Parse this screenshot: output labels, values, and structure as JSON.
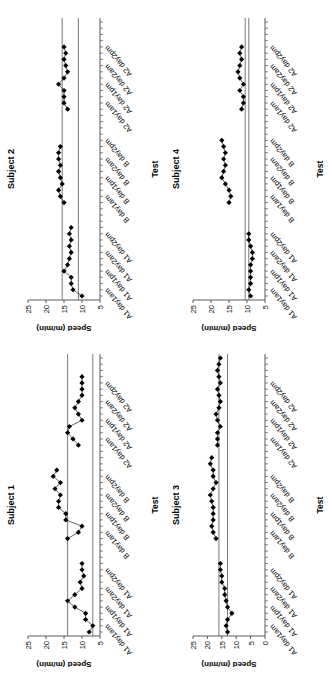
{
  "chart_data": [
    {
      "type": "line",
      "title": "Subject 2",
      "xlabel": "Test",
      "ylabel": "Speed (m/min)",
      "ylim": [
        5,
        25
      ],
      "yticks": [
        5,
        10,
        15,
        20,
        25
      ],
      "tick_labels": [
        "A1 day1am",
        "A1 day1pm",
        "A1 day2am",
        "A1 day2pm",
        "B day1am",
        "B day1pm",
        "B day2am",
        "B day2pm",
        "A2 day1am",
        "A2 day1pm",
        "A2 day2am",
        "A2 day2pm"
      ],
      "reference_lines": [
        11,
        15.5
      ],
      "series": [
        {
          "name": "A1",
          "values": [
            10,
            12.5,
            13,
            13,
            15,
            14,
            13.5,
            13,
            13.5,
            13,
            13.5,
            13
          ]
        },
        {
          "name": "B",
          "values": [
            15,
            16,
            16.5,
            15.5,
            16,
            16.5,
            16,
            16.5,
            16.5,
            16
          ]
        },
        {
          "name": "A2",
          "values": [
            14,
            15,
            15,
            15,
            16.5,
            15,
            14,
            14.5,
            15,
            14.5,
            15
          ]
        }
      ]
    },
    {
      "type": "line",
      "title": "Subject 4",
      "xlabel": "Test",
      "ylabel": "Speed (m/min)",
      "ylim": [
        5,
        25
      ],
      "yticks": [
        5,
        10,
        15,
        20,
        25
      ],
      "tick_labels": [
        "A1 day1am",
        "A1 day1pm",
        "A1 day2am",
        "A1 day2pm",
        "B day1am",
        "B day1pm",
        "B day2am",
        "B day2pm",
        "A2 day1am",
        "A2 day1pm",
        "A2 day2am",
        "A2 day2pm"
      ],
      "reference_lines": [
        9.5,
        10.5
      ],
      "series": [
        {
          "name": "A1",
          "values": [
            9,
            9.5,
            9,
            9,
            9,
            9,
            8.5,
            8.5,
            9,
            9.5,
            9.5
          ]
        },
        {
          "name": "B",
          "values": [
            15,
            14.5,
            15,
            16,
            17,
            16.5,
            16,
            16.5,
            16,
            16.5,
            17
          ]
        },
        {
          "name": "A2",
          "values": [
            11.5,
            11,
            11,
            12,
            11,
            12,
            12.5,
            12,
            11.5,
            12,
            11.5
          ]
        }
      ]
    },
    {
      "type": "line",
      "title": "Subject 1",
      "xlabel": "Test",
      "ylabel": "Speed (m/min)",
      "ylim": [
        5,
        25
      ],
      "yticks": [
        5,
        10,
        15,
        20,
        25
      ],
      "tick_labels": [
        "A1 day1am",
        "A1 day1pm",
        "A1 day2am",
        "A1 day2pm",
        "B day1am",
        "B day1pm",
        "B day2am",
        "B day2pm",
        "A2 day1am",
        "A2 day1pm",
        "A2 day2am",
        "A2 day2pm"
      ],
      "reference_lines": [
        7,
        14
      ],
      "series": [
        {
          "name": "A1",
          "values": [
            8,
            7,
            9,
            9,
            12,
            14,
            12,
            10,
            10.5,
            9.5,
            10,
            10
          ]
        },
        {
          "name": "B",
          "values": [
            14,
            11,
            10,
            14.5,
            14.5,
            16.5,
            16.5,
            16,
            17.5,
            16,
            18,
            17
          ]
        },
        {
          "name": "A2",
          "values": [
            11,
            12.5,
            14,
            13.5,
            10,
            11,
            12,
            11,
            10,
            10,
            10,
            10
          ]
        }
      ]
    },
    {
      "type": "line",
      "title": "Subject 3",
      "xlabel": "Test",
      "ylabel": "Speed (m/min)",
      "ylim": [
        0,
        25
      ],
      "yticks": [
        0,
        5,
        10,
        15,
        20,
        25
      ],
      "tick_labels": [
        "A1 day1am",
        "A1 day1pm",
        "A1 day2am",
        "A1 day2pm",
        "B day1am",
        "B day1pm",
        "B day2am",
        "B day2pm",
        "A2 day1am",
        "A2 day1pm",
        "A2 day2am",
        "A2 day2pm"
      ],
      "reference_lines": [
        13,
        16
      ],
      "series": [
        {
          "name": "A1",
          "values": [
            13,
            13.5,
            13,
            11.5,
            13,
            13.5,
            14,
            14,
            15,
            15,
            15.5,
            15.5
          ]
        },
        {
          "name": "B",
          "values": [
            17,
            18,
            18.5,
            18,
            18,
            18,
            18.5,
            19,
            18,
            17,
            18,
            18,
            19,
            18.5
          ]
        },
        {
          "name": "A2",
          "values": [
            16.5,
            16.5,
            16.5,
            15.5,
            16.5,
            17,
            16,
            15.5,
            16,
            16.5,
            15.5,
            16,
            16.5,
            16,
            15.5
          ]
        }
      ]
    }
  ],
  "panels": [
    {
      "title": "Subject 2",
      "ylabel": "Speed (m/min)",
      "xlabel": "Test"
    },
    {
      "title": "Subject 4",
      "ylabel": "Speed (m/min)",
      "xlabel": "Test"
    },
    {
      "title": "Subject 1",
      "ylabel": "Speed (m/min)",
      "xlabel": "Test"
    },
    {
      "title": "Subject 3",
      "ylabel": "Speed (m/min)",
      "xlabel": "Test"
    }
  ]
}
